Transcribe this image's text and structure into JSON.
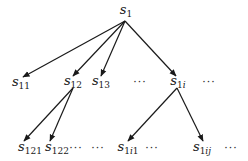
{
  "diagram": {
    "type": "tree",
    "edge_color": "#1a1a1a",
    "nodes": [
      {
        "id": "s1",
        "base": "s",
        "sub": "1",
        "x": 126,
        "y": 11
      },
      {
        "id": "s11",
        "base": "s",
        "sub": "11",
        "x": 21,
        "y": 83
      },
      {
        "id": "s12",
        "base": "s",
        "sub": "12",
        "x": 73,
        "y": 82
      },
      {
        "id": "s13",
        "base": "s",
        "sub": "13",
        "x": 101,
        "y": 82
      },
      {
        "id": "s1i",
        "base": "s",
        "sub": "1i",
        "x": 178,
        "y": 82
      },
      {
        "id": "s121",
        "base": "s",
        "sub": "121",
        "x": 30,
        "y": 148
      },
      {
        "id": "s122",
        "base": "s",
        "sub": "122",
        "x": 57,
        "y": 148
      },
      {
        "id": "s1i1",
        "base": "s",
        "sub": "1i1",
        "x": 128,
        "y": 148
      },
      {
        "id": "s1ij",
        "base": "s",
        "sub": "1ij",
        "x": 202,
        "y": 148
      }
    ],
    "ellipses": [
      {
        "text": "···",
        "x": 140,
        "y": 82
      },
      {
        "text": "···",
        "x": 209,
        "y": 82
      },
      {
        "text": "···",
        "x": 76,
        "y": 148
      },
      {
        "text": "···",
        "x": 98,
        "y": 148
      },
      {
        "text": "···",
        "x": 152,
        "y": 148
      },
      {
        "text": "···",
        "x": 231,
        "y": 148
      }
    ],
    "edges": [
      {
        "from": "s1",
        "to": "s11",
        "x1": 125,
        "y1": 21,
        "x2": 23,
        "y2": 77
      },
      {
        "from": "s1",
        "to": "s12",
        "x1": 125,
        "y1": 21,
        "x2": 73,
        "y2": 76
      },
      {
        "from": "s1",
        "to": "s13",
        "x1": 125,
        "y1": 21,
        "x2": 101,
        "y2": 76
      },
      {
        "from": "s1",
        "to": "s1i",
        "x1": 125,
        "y1": 21,
        "x2": 176,
        "y2": 76
      },
      {
        "from": "s12",
        "to": "s121",
        "x1": 73,
        "y1": 88,
        "x2": 24,
        "y2": 141
      },
      {
        "from": "s12",
        "to": "s122",
        "x1": 73,
        "y1": 88,
        "x2": 50,
        "y2": 141
      },
      {
        "from": "s1i",
        "to": "s1i1",
        "x1": 177,
        "y1": 88,
        "x2": 128,
        "y2": 141
      },
      {
        "from": "s1i",
        "to": "s1ij",
        "x1": 177,
        "y1": 88,
        "x2": 203,
        "y2": 141
      }
    ]
  }
}
